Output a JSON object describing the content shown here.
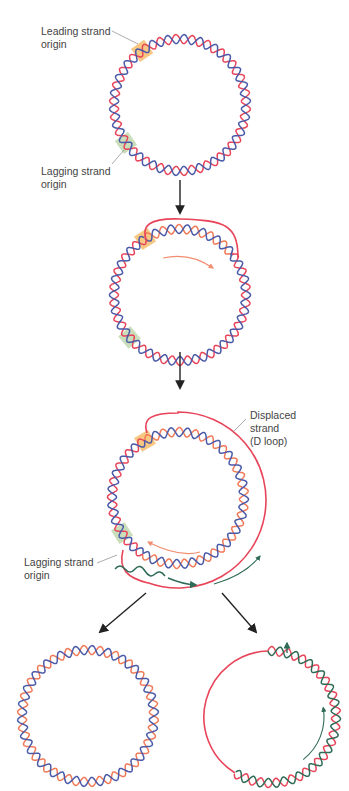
{
  "figure": {
    "colors": {
      "parental_strand_red": "#e8455a",
      "parental_strand_blue": "#4a5aa8",
      "new_leading_strand_orange": "#f07a58",
      "new_lagging_strand_green": "#2f6b55",
      "leading_origin_highlight": "#f5b55a",
      "lagging_origin_highlight": "#b9d3a6",
      "arrow_black": "#222222",
      "label_gray": "#444444"
    },
    "stages": [
      {
        "id": "stage-1",
        "description": "Parental circular double helix with two origins",
        "labels": {
          "leading_origin": "Leading strand\norigin",
          "lagging_origin": "Lagging strand\norigin"
        }
      },
      {
        "id": "stage-2",
        "description": "Leading strand synthesis begins, displacing parental red strand"
      },
      {
        "id": "stage-3",
        "description": "D loop enlarges; lagging strand origin exposed and lagging synthesis begins",
        "labels": {
          "displaced_strand": "Displaced\nstrand\n(D loop)",
          "lagging_origin": "Lagging strand\norigin"
        }
      },
      {
        "id": "stage-4a",
        "description": "Completed daughter molecule: blue parental + orange new strand"
      },
      {
        "id": "stage-4b",
        "description": "Daughter molecule: red parental + green new lagging strand (partially complete)"
      }
    ]
  }
}
